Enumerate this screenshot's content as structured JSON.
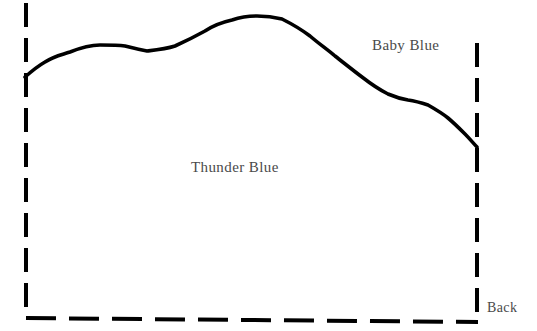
{
  "diagram": {
    "type": "stratigraphic-cross-section-sketch",
    "background_color": "#ffffff",
    "stroke_color": "#000000",
    "label_color": "#4a4a4a",
    "labels": {
      "upper_unit": "Baby Blue",
      "lower_unit": "Thunder Blue",
      "back_edge": "Back"
    },
    "boundaries": {
      "left_edge": {
        "style": "dashed",
        "orientation": "vertical",
        "x": 26,
        "y_start": 3,
        "y_end": 315
      },
      "right_edge": {
        "style": "dashed",
        "orientation": "vertical",
        "x": 477,
        "y_start": 43,
        "y_end": 318
      },
      "bottom_edge": {
        "style": "dashed",
        "orientation": "horizontal",
        "x_start": 26,
        "x_end": 478,
        "y_start": 318,
        "y_end": 322
      },
      "top_contact_curve": {
        "style": "solid",
        "x_start": 25,
        "y_start": 77,
        "x_end": 477,
        "y_end": 147,
        "points": [
          [
            25,
            77
          ],
          [
            45,
            62
          ],
          [
            70,
            52
          ],
          [
            100,
            45
          ],
          [
            125,
            46
          ],
          [
            147,
            51
          ],
          [
            175,
            46
          ],
          [
            205,
            31
          ],
          [
            232,
            20
          ],
          [
            257,
            16
          ],
          [
            282,
            19
          ],
          [
            310,
            36
          ],
          [
            335,
            56
          ],
          [
            362,
            77
          ],
          [
            388,
            94
          ],
          [
            408,
            100
          ],
          [
            428,
            105
          ],
          [
            448,
            118
          ],
          [
            465,
            134
          ],
          [
            477,
            147
          ]
        ]
      }
    }
  }
}
